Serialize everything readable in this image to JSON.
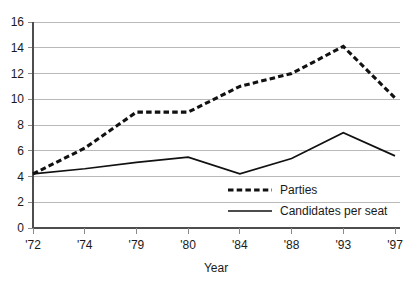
{
  "chart_data": {
    "type": "line",
    "title": "",
    "xlabel": "Year",
    "ylabel": "",
    "categories": [
      "'72",
      "'74",
      "'79",
      "'80",
      "'84",
      "'88",
      "'93",
      "'97"
    ],
    "ylim": [
      0,
      16
    ],
    "ytick_step": 2,
    "yticks": [
      "0",
      "2",
      "4",
      "6",
      "8",
      "10",
      "12",
      "14",
      "16"
    ],
    "grid": "horizontal",
    "legend_position": "inside lower-right",
    "series": [
      {
        "name": "Parties",
        "style": "dashed",
        "color": "#111111",
        "values": [
          4.2,
          6.2,
          9.0,
          9.0,
          11.0,
          12.0,
          14.1,
          10.1
        ]
      },
      {
        "name": "Candidates per seat",
        "style": "solid",
        "color": "#111111",
        "values": [
          4.2,
          4.6,
          5.1,
          5.5,
          4.2,
          5.4,
          7.4,
          5.6
        ]
      }
    ]
  }
}
